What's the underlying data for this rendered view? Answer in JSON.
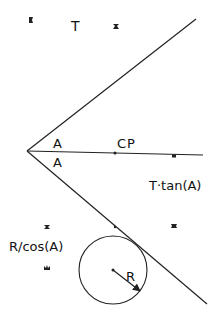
{
  "diagram": {
    "type": "geometry",
    "labels": {
      "top": "T",
      "angle_upper": "A",
      "angle_lower": "A",
      "center_point": "CP",
      "offset": "T·tan(A)",
      "distance": "R/cos(A)",
      "radius": "R"
    },
    "geometry": {
      "vertex": [
        27,
        151
      ],
      "upper_line_end": [
        196,
        19
      ],
      "lower_line_end": [
        207,
        304
      ],
      "bisector_end": [
        203,
        155
      ],
      "cp_point": [
        115,
        153
      ],
      "bisector_dot": [
        174,
        156
      ],
      "lower_line_dot": [
        115,
        227
      ],
      "circle_center": [
        113,
        270
      ],
      "circle_radius": 34,
      "radius_arrow_end": [
        140,
        291
      ]
    },
    "markers": [
      [
        31,
        20
      ],
      [
        116,
        26
      ],
      [
        47,
        227
      ],
      [
        47,
        268
      ],
      [
        174,
        226
      ]
    ],
    "colors": {
      "stroke": "#222222",
      "background": "#ffffff"
    }
  }
}
